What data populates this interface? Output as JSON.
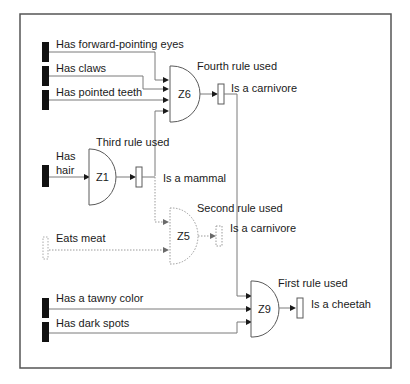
{
  "diagram": {
    "type": "rule-inference-network",
    "inputs": [
      {
        "id": "in-forward-eyes",
        "label": "Has forward-pointing eyes",
        "active": true
      },
      {
        "id": "in-claws",
        "label": "Has claws",
        "active": true
      },
      {
        "id": "in-pointed-teeth",
        "label": "Has pointed teeth",
        "active": true
      },
      {
        "id": "in-hair",
        "label_line1": "Has",
        "label_line2": "hair",
        "active": true
      },
      {
        "id": "in-eats-meat",
        "label": "Eats meat",
        "active": false
      },
      {
        "id": "in-tawny",
        "label": "Has a tawny color",
        "active": true
      },
      {
        "id": "in-dark-spots",
        "label": "Has dark spots",
        "active": true
      }
    ],
    "gates": [
      {
        "id": "Z6",
        "label": "Z6",
        "rule_label": "Fourth rule used",
        "output_label": "Is a carnivore",
        "active": true
      },
      {
        "id": "Z1",
        "label": "Z1",
        "rule_label": "Third rule used",
        "output_label": "Is a mammal",
        "active": true
      },
      {
        "id": "Z5",
        "label": "Z5",
        "rule_label": "Second rule used",
        "output_label": "Is a carnivore",
        "active": false
      },
      {
        "id": "Z9",
        "label": "Z9",
        "rule_label": "First rule used",
        "output_label": "Is a cheetah",
        "active": true
      }
    ],
    "colors": {
      "active_input": "#111111",
      "wire": "#7a7a7a",
      "inactive": "#9a9a9a",
      "frame": "#555555"
    }
  }
}
